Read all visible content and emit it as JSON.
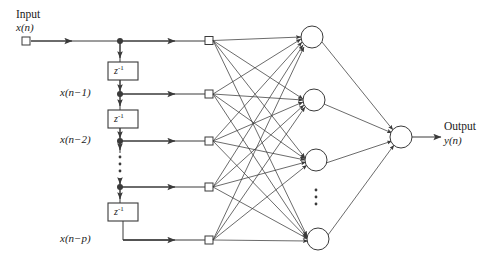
{
  "figure": {
    "background": "#ffffff",
    "line_color": "#3a3a3a",
    "node_fill": "#ffffff",
    "node_stroke": "#3a3a3a"
  },
  "input": {
    "header_label": "Input",
    "signal_label_x": "x",
    "signal_label_open": "(",
    "signal_label_n": "n",
    "signal_label_close": ")",
    "signal_label_full": "x(n)",
    "terminal_icon": "square-terminal-icon"
  },
  "output": {
    "header_label": "Output",
    "signal_label_full": "y(n)",
    "signal_label_y": "y",
    "signal_label_n": "n"
  },
  "delay_line": {
    "delay_block_label": "z",
    "delay_block_exponent": "-1",
    "delay_block_full": "z^-1",
    "delay_blocks": [
      {
        "id": "delay-1",
        "label": "z",
        "exponent": "-1"
      },
      {
        "id": "delay-2",
        "label": "z",
        "exponent": "-1"
      },
      {
        "id": "delay-3",
        "label": "z",
        "exponent": "-1"
      }
    ],
    "vertical_ellipsis": "⋮",
    "taps": [
      {
        "id": "tap-0",
        "label": "x(n)",
        "label_shown": false,
        "y": 41
      },
      {
        "id": "tap-1",
        "label": "x(n−1)",
        "label_shown": true,
        "y": 94
      },
      {
        "id": "tap-2",
        "label": "x(n−2)",
        "label_shown": true,
        "y": 141
      },
      {
        "id": "tap-3",
        "label": "",
        "label_shown": false,
        "y": 187
      },
      {
        "id": "tap-4",
        "label": "x(n−p)",
        "label_shown": true,
        "y": 240
      }
    ]
  },
  "tap_labels": {
    "t1": "x(n−1)",
    "t2": "x(n−2)",
    "t4": "x(n−p)"
  },
  "layers": {
    "input_nodes": [
      {
        "id": "in-1",
        "x": 209,
        "y": 40
      },
      {
        "id": "in-2",
        "x": 209,
        "y": 94
      },
      {
        "id": "in-3",
        "x": 209,
        "y": 141
      },
      {
        "id": "in-4",
        "x": 209,
        "y": 187
      },
      {
        "id": "in-5",
        "x": 209,
        "y": 240
      }
    ],
    "hidden_nodes": [
      {
        "id": "hid-1",
        "x": 312,
        "y": 37,
        "r": 11
      },
      {
        "id": "hid-2",
        "x": 314,
        "y": 100,
        "r": 11
      },
      {
        "id": "hid-3",
        "x": 316,
        "y": 160,
        "r": 11
      },
      {
        "id": "hid-4",
        "x": 318,
        "y": 239,
        "r": 11
      }
    ],
    "hidden_ellipsis": "⋮",
    "output_node": {
      "id": "out-1",
      "x": 401,
      "y": 137,
      "r": 11
    }
  },
  "counts": {
    "input_terminals": 5,
    "hidden_units": 4,
    "output_units": 1,
    "delay_elements": 3
  }
}
